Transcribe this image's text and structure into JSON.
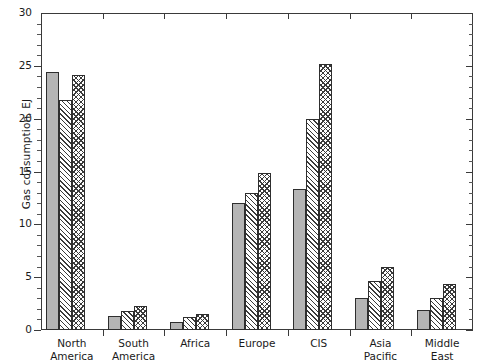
{
  "chart_data": {
    "type": "bar",
    "title": "",
    "subtitle": "",
    "xlabel": "",
    "ylabel": "Gas consumption, EJ",
    "ylim": [
      0,
      30
    ],
    "ytick_labels": [
      "0",
      "5",
      "10",
      "15",
      "20",
      "25",
      "30"
    ],
    "ytick_values": [
      0,
      5,
      10,
      15,
      20,
      25,
      30
    ],
    "yminor_step": 1,
    "grid": false,
    "legend": "none",
    "categories": [
      "North America",
      "South America",
      "Africa",
      "Europe",
      "CIS",
      "Asia Pacific",
      "Middle East"
    ],
    "category_lines": [
      [
        "North",
        "America"
      ],
      [
        "South",
        "America"
      ],
      [
        "Africa",
        ""
      ],
      [
        "Europe",
        ""
      ],
      [
        "CIS",
        ""
      ],
      [
        "Asia",
        "Pacific"
      ],
      [
        "Middle",
        "East"
      ]
    ],
    "series": [
      {
        "name": "series-1",
        "pattern": "solid-gray",
        "color": "#b5b5b5",
        "values": [
          24.4,
          1.3,
          0.8,
          12.0,
          13.3,
          3.0,
          1.9
        ]
      },
      {
        "name": "series-2",
        "pattern": "diagonal-hatch",
        "color": "#ffffff",
        "values": [
          21.8,
          1.8,
          1.2,
          13.0,
          20.0,
          4.6,
          3.0
        ]
      },
      {
        "name": "series-3",
        "pattern": "cross-hatch",
        "color": "#ffffff",
        "values": [
          24.1,
          2.3,
          1.5,
          14.9,
          25.2,
          6.0,
          4.4
        ]
      }
    ]
  }
}
